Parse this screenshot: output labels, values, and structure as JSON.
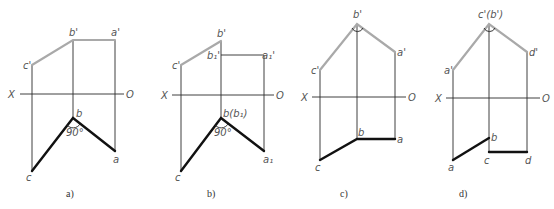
{
  "figure": {
    "panels": [
      {
        "id": "a",
        "caption": "a)",
        "axis": {
          "x_label": "X",
          "o_label": "O"
        },
        "labels": {
          "c_prime": "c'",
          "b_prime": "b'",
          "a_prime": "a'",
          "b": "b",
          "a": "a",
          "c": "c",
          "angle": "90°"
        }
      },
      {
        "id": "b",
        "caption": "b)",
        "axis": {
          "x_label": "X",
          "o_label": "O"
        },
        "labels": {
          "c_prime": "c'",
          "b_prime": "b'",
          "b1_prime": "b₁'",
          "a1_prime": "a₁'",
          "b": "b(b₁)",
          "a1": "a₁",
          "c": "c",
          "angle": "90°"
        }
      },
      {
        "id": "c",
        "caption": "c)",
        "axis": {
          "x_label": "X",
          "o_label": "O"
        },
        "labels": {
          "b_prime": "b'",
          "a_prime": "a'",
          "c_prime": "c'",
          "b": "b",
          "a": "a",
          "c": "c"
        }
      },
      {
        "id": "d",
        "caption": "d)",
        "axis": {
          "x_label": "X",
          "o_label": "O"
        },
        "labels": {
          "cb_prime": "c'(b')",
          "d_prime": "d'",
          "a_prime": "a'",
          "b": "b",
          "c": "c",
          "d": "d",
          "a": "a"
        }
      }
    ]
  }
}
